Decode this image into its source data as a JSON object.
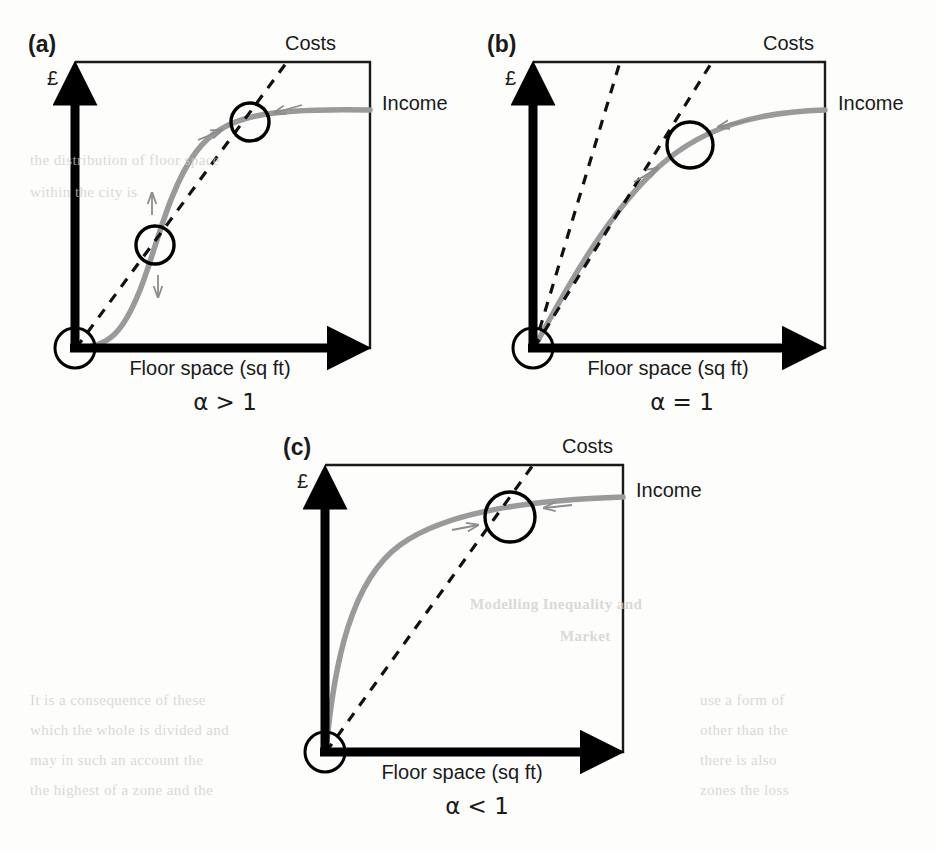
{
  "figure": {
    "domain": "diagram",
    "type": "economics-equilibrium-diagram",
    "panels": [
      {
        "id": "a",
        "panel_label": "(a)",
        "caption": "α > 1",
        "y_axis_label": "£",
        "x_axis_label": "Floor space (sq ft)",
        "costs_label": "Costs",
        "income_label": "Income",
        "frame": {
          "x": 75,
          "y": 62,
          "w": 295,
          "h": 286
        },
        "income_curve_shape": "sigmoid (S-shaped)",
        "cost_lines": 1,
        "equilibria": [
          {
            "name": "origin",
            "cx": 75,
            "cy": 348,
            "r": 20,
            "stable": true
          },
          {
            "name": "low-unstable",
            "cx": 155,
            "cy": 245,
            "r": 19,
            "stable": false
          },
          {
            "name": "high-stable",
            "cx": 250,
            "cy": 122,
            "r": 19,
            "stable": true
          }
        ],
        "arrows": [
          "up",
          "down",
          "right",
          "left"
        ]
      },
      {
        "id": "b",
        "panel_label": "(b)",
        "caption": "α = 1",
        "y_axis_label": "£",
        "x_axis_label": "Floor space (sq ft)",
        "costs_label": "Costs",
        "income_label": "Income",
        "frame": {
          "x": 533,
          "y": 62,
          "w": 292,
          "h": 286
        },
        "income_curve_shape": "concave (diminishing returns)",
        "cost_lines": 2,
        "equilibria": [
          {
            "name": "origin",
            "cx": 533,
            "cy": 348,
            "r": 20,
            "stable": true
          },
          {
            "name": "tangency",
            "cx": 690,
            "cy": 145,
            "r": 23,
            "stable": true
          }
        ],
        "arrows": [
          "right",
          "left"
        ]
      },
      {
        "id": "c",
        "panel_label": "(c)",
        "caption": "α < 1",
        "y_axis_label": "£",
        "x_axis_label": "Floor space (sq ft)",
        "costs_label": "Costs",
        "income_label": "Income",
        "frame": {
          "x": 325,
          "y": 465,
          "w": 298,
          "h": 287
        },
        "income_curve_shape": "concave (strongly diminishing returns)",
        "cost_lines": 1,
        "equilibria": [
          {
            "name": "origin",
            "cx": 325,
            "cy": 752,
            "r": 20,
            "stable": false
          },
          {
            "name": "stable",
            "cx": 510,
            "cy": 517,
            "r": 25,
            "stable": true
          }
        ],
        "arrows": [
          "right",
          "left"
        ]
      }
    ],
    "colors": {
      "income_curve": "#9a9a9a",
      "cost_line": "#111111",
      "axis": "#000000",
      "frame": "#1a1a1a",
      "arrow_gray": "#8c8c8c",
      "page_background": "#fdfdfc"
    }
  },
  "background_ghost_text": [
    {
      "text": "■ Modelling   Inequality   and",
      "x": 470,
      "y": 605
    },
    {
      "text": "Market",
      "x": 470,
      "y": 640
    },
    {
      "text": "the  distribution   of  floor   space",
      "x": 58,
      "y": 160
    },
    {
      "text": "within  the  city  is",
      "x": 58,
      "y": 190
    }
  ]
}
